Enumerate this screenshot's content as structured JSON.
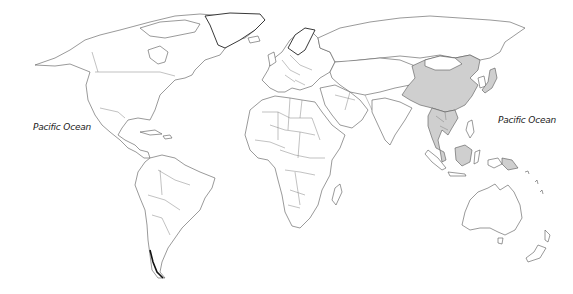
{
  "map": {
    "type": "world political outline map",
    "background_color": "#ffffff",
    "land_color": "#ffffff",
    "outline_color": "#555555",
    "highlight_color": "#cfcfcf",
    "highlighted_regions": [
      "China",
      "Japan",
      "Mainland Southeast Asia (Myanmar, Thailand, Laos, Cambodia, Vietnam)",
      "Malaysia",
      "Indonesia (Borneo/Kalimantan)",
      "Papua New Guinea"
    ],
    "labels": [
      {
        "id": "pacific-west",
        "text": "Pacific Ocean"
      },
      {
        "id": "pacific-east",
        "text": "Pacific Ocean"
      }
    ],
    "top_mark": "'"
  }
}
